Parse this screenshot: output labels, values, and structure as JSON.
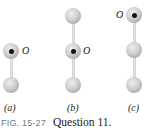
{
  "figure": {
    "caption_label": "FIG. 15-27",
    "caption_text": "Question 11.",
    "pivot_label": "O",
    "panels": [
      {
        "id": "a",
        "label": "(a)",
        "balls": 2,
        "pivot_position": "top",
        "label_side": "right"
      },
      {
        "id": "b",
        "label": "(b)",
        "balls": 3,
        "pivot_position": "middle",
        "label_side": "right"
      },
      {
        "id": "c",
        "label": "(c)",
        "balls": 3,
        "pivot_position": "top",
        "label_side": "left"
      }
    ]
  },
  "colors": {
    "ball": "#c4c4c4",
    "rod": "#d8d8d8",
    "pivot": "#111111",
    "caption_fig": "#6a7a8a"
  }
}
